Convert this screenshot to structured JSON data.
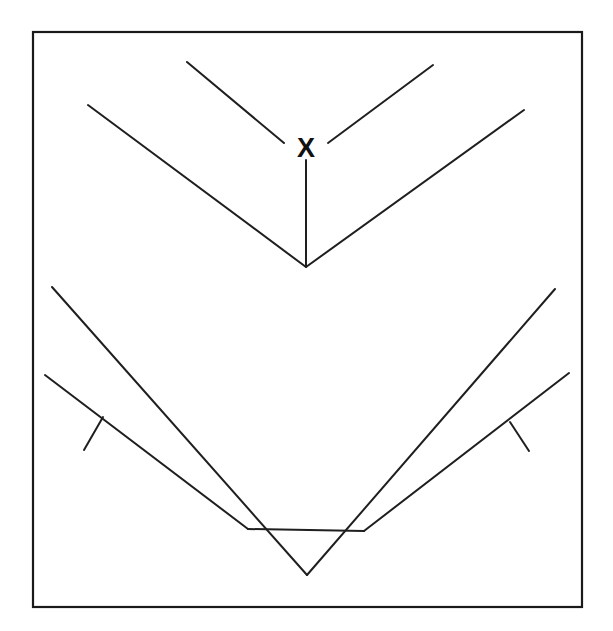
{
  "figure": {
    "canvas": {
      "width": 613,
      "height": 631,
      "background": "#ffffff"
    },
    "frame": {
      "name": "outer-border",
      "x": 33,
      "y": 32,
      "width": 549,
      "height": 575,
      "stroke": "#1a1a1a",
      "stroke_width": 2.2,
      "fill": "#ffffff"
    },
    "stroke_color": "#1f1f1f",
    "stroke_width": 2,
    "labels": [
      {
        "name": "vertex-label-x",
        "text": "X",
        "x": 306,
        "y": 150,
        "font_size": 27,
        "bold": true,
        "color": "#111111"
      }
    ],
    "segments": [
      {
        "name": "upper-inner-left-segment",
        "x1": 187,
        "y1": 62,
        "x2": 284,
        "y2": 143
      },
      {
        "name": "upper-inner-right-segment",
        "x1": 328,
        "y1": 143,
        "x2": 433,
        "y2": 65
      },
      {
        "name": "upper-vertical-stem",
        "x1": 306,
        "y1": 160,
        "x2": 306,
        "y2": 266
      },
      {
        "name": "upper-chevron-left-arm",
        "x1": 88,
        "y1": 105,
        "x2": 306,
        "y2": 267
      },
      {
        "name": "upper-chevron-right-arm",
        "x1": 306,
        "y1": 267,
        "x2": 524,
        "y2": 110
      },
      {
        "name": "lower-outer-chevron-left-arm",
        "x1": 52,
        "y1": 287,
        "x2": 307,
        "y2": 575
      },
      {
        "name": "lower-outer-chevron-right-arm",
        "x1": 307,
        "y1": 575,
        "x2": 555,
        "y2": 289
      },
      {
        "name": "lower-inner-chevron-left-arm",
        "x1": 45,
        "y1": 375,
        "x2": 248,
        "y2": 529
      },
      {
        "name": "lower-inner-chevron-horizontal-left",
        "x1": 248,
        "y1": 529,
        "x2": 364,
        "y2": 531
      },
      {
        "name": "lower-inner-chevron-right-arm",
        "x1": 364,
        "y1": 531,
        "x2": 569,
        "y2": 373
      },
      {
        "name": "left-tick-mark",
        "x1": 84,
        "y1": 450,
        "x2": 103,
        "y2": 417
      },
      {
        "name": "right-tick-mark",
        "x1": 510,
        "y1": 422,
        "x2": 529,
        "y2": 451
      }
    ]
  }
}
